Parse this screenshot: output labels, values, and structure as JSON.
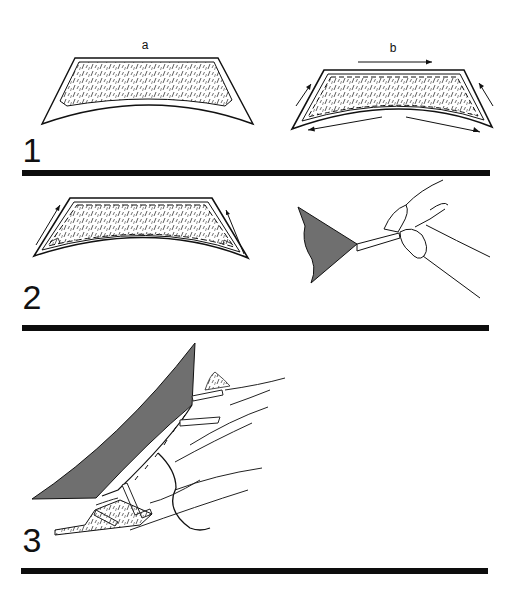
{
  "figure": {
    "title": "",
    "panels": [
      {
        "number": "1",
        "sublabels": [
          "a",
          "b"
        ],
        "description": "Fabric facing piece with interfacing (a); stitched around edges with arrows indicating stitching direction (b)"
      },
      {
        "number": "2",
        "sublabels": [],
        "description": "Stitched piece with corners marked; fingers pulling/turning a corner point of dark fabric"
      },
      {
        "number": "3",
        "sublabels": [],
        "description": "Dark fabric edge being hand-sewn to facing over fingers with thread"
      }
    ]
  },
  "colors": {
    "ink": "#111111",
    "fabric_dark": "#6f6f6f",
    "fabric_shadow": "#4a4a4a",
    "background": "#ffffff",
    "rule": "#0d0d0d"
  }
}
